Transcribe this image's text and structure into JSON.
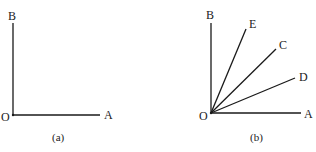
{
  "figures": [
    {
      "id": "a",
      "caption": "(a)",
      "origin": {
        "label": "O",
        "x": 13,
        "y": 115
      },
      "rays": [
        {
          "name": "OB",
          "label": "B",
          "end": [
            13,
            23
          ],
          "label_pos": [
            8,
            20
          ]
        },
        {
          "name": "OA",
          "label": "A",
          "end": [
            100,
            115
          ],
          "label_pos": [
            104,
            119
          ]
        }
      ],
      "origin_label_pos": [
        1,
        121
      ],
      "caption_pos": [
        52,
        141
      ]
    },
    {
      "id": "b",
      "caption": "(b)",
      "origin": {
        "label": "O",
        "x": 211,
        "y": 113
      },
      "rays": [
        {
          "name": "OB",
          "label": "B",
          "end": [
            211,
            23
          ],
          "label_pos": [
            206,
            19
          ]
        },
        {
          "name": "OE",
          "label": "E",
          "end": [
            246,
            29
          ],
          "label_pos": [
            249,
            28
          ]
        },
        {
          "name": "OC",
          "label": "C",
          "end": [
            276,
            49
          ],
          "label_pos": [
            279,
            49
          ]
        },
        {
          "name": "OD",
          "label": "D",
          "end": [
            295,
            78
          ],
          "label_pos": [
            299,
            81
          ]
        },
        {
          "name": "OA",
          "label": "A",
          "end": [
            301,
            113
          ],
          "label_pos": [
            304,
            118
          ]
        }
      ],
      "origin_label_pos": [
        199,
        120
      ],
      "caption_pos": [
        250,
        141
      ]
    }
  ]
}
